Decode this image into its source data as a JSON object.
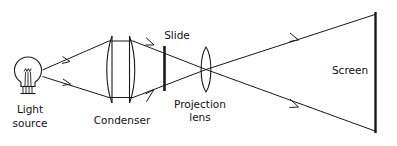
{
  "diagram": {
    "background_color": "#ffffff",
    "line_color": "#1a1a1a",
    "text_color": "#111111",
    "labels": {
      "light_source_line1": "Light",
      "light_source_line2": "source",
      "condenser": "Condenser",
      "slide": "Slide",
      "projection_lens_line1": "Projection",
      "projection_lens_line2": "lens",
      "screen": "Screen"
    },
    "components": [
      {
        "name": "light-source",
        "type": "incandescent-bulb",
        "label": "Light source",
        "x": 28,
        "y": 68
      },
      {
        "name": "condenser",
        "type": "lens-pair",
        "label": "Condenser",
        "x": 121,
        "y": 68
      },
      {
        "name": "slide",
        "type": "vertical-bar",
        "label": "Slide",
        "x": 164,
        "y": 68
      },
      {
        "name": "projection-lens",
        "type": "biconvex-lens",
        "label": "Projection lens",
        "x": 206,
        "y": 68
      },
      {
        "name": "screen",
        "type": "vertical-bar",
        "label": "Screen",
        "x": 376,
        "y": 72
      }
    ],
    "ray_arrow_count": 4,
    "ray_direction": "left-to-right"
  }
}
